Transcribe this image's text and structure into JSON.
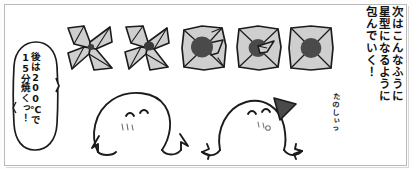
{
  "panel": {
    "width": 411,
    "height": 170,
    "background_color": "#ffffff",
    "frame_color": "#b9b9b9",
    "ink_color": "#1a1a1a",
    "paper_fill_color": "#cfcfcf",
    "filling_color": "#4a4a4a"
  },
  "narration": {
    "name": "narration-text",
    "reading_direction": "vertical-right-to-left",
    "lines": [
      "次はこんなふうに",
      "星型になるように",
      "包んでいく！"
    ]
  },
  "speech_balloon": {
    "name": "speech-balloon",
    "speaker": "left-character",
    "lines": [
      "後は200℃で",
      "15分焼くっ！"
    ]
  },
  "side_note": {
    "name": "tanoshii-note",
    "text": "たのしぃっ"
  },
  "steps": [
    {
      "id": "step-1",
      "label": "pinwheel-fold-open",
      "has_filling": false,
      "filling_size": "none",
      "description": "四隅を折り広げた風車状"
    },
    {
      "id": "step-2",
      "label": "pinwheel-fold-small-center",
      "has_filling": true,
      "filling_size": "small",
      "description": "中心に小さな具"
    },
    {
      "id": "step-3",
      "label": "square-with-filling",
      "has_filling": true,
      "filling_size": "large",
      "description": "具をのせた四角"
    },
    {
      "id": "step-4",
      "label": "folding-corners-in",
      "has_filling": true,
      "filling_size": "medium",
      "description": "角を内側に折り込む"
    },
    {
      "id": "step-5",
      "label": "finished-star-wrap",
      "has_filling": true,
      "filling_size": "large",
      "description": "星型に包み終えた状態"
    }
  ],
  "characters": [
    {
      "id": "char-left",
      "label": "blob-character-cheering",
      "has_hair_triangle": false,
      "pose": "arms-raised"
    },
    {
      "id": "char-right",
      "label": "blob-character-with-hair",
      "has_hair_triangle": true,
      "pose": "arms-raised"
    }
  ]
}
